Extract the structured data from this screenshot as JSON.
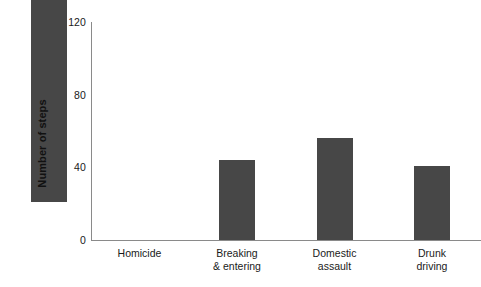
{
  "chart_data": {
    "type": "bar",
    "title": "",
    "xlabel": "",
    "ylabel": "Number of steps",
    "categories": [
      "Homicide",
      "Breaking & entering",
      "Domestic assault",
      "Drunk driving"
    ],
    "category_lines": [
      [
        "Homicide"
      ],
      [
        "Breaking",
        "& entering"
      ],
      [
        "Domestic",
        "assault"
      ],
      [
        "Drunk",
        "driving"
      ]
    ],
    "values": [
      111,
      44,
      56,
      41
    ],
    "ylim": [
      0,
      120
    ],
    "yticks": [
      0,
      40,
      80,
      120
    ],
    "ytick_labels": [
      "0",
      "40",
      "80",
      "120"
    ],
    "grid": false,
    "legend": false,
    "bar_color": "#474747",
    "axis_color": "#8a8a8a",
    "text_color": "#1a1a1a"
  }
}
